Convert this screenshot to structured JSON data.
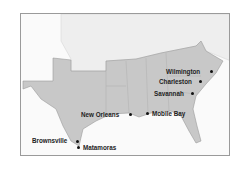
{
  "map": {
    "title": "",
    "colors": {
      "confederacy": "#c8c8c8",
      "union": "#eeeeee",
      "border": "#9a9a9a",
      "ocean": "#fafafa",
      "text": "#222222"
    },
    "cities": [
      {
        "name": "Wilmington",
        "x": 211,
        "y": 71,
        "label_x": 166,
        "label_y": 68
      },
      {
        "name": "Charleston",
        "x": 200,
        "y": 81,
        "label_x": 159,
        "label_y": 78
      },
      {
        "name": "Savannah",
        "x": 192,
        "y": 93,
        "label_x": 154,
        "label_y": 90
      },
      {
        "name": "New Orleans",
        "x": 130,
        "y": 114,
        "label_x": 81,
        "label_y": 111
      },
      {
        "name": "Mobile Bay",
        "x": 147,
        "y": 113,
        "label_x": 152,
        "label_y": 110
      },
      {
        "name": "Brownsville",
        "x": 77,
        "y": 141,
        "label_x": 32,
        "label_y": 137
      },
      {
        "name": "Matamoras",
        "x": 78,
        "y": 147,
        "label_x": 83,
        "label_y": 144
      }
    ]
  }
}
